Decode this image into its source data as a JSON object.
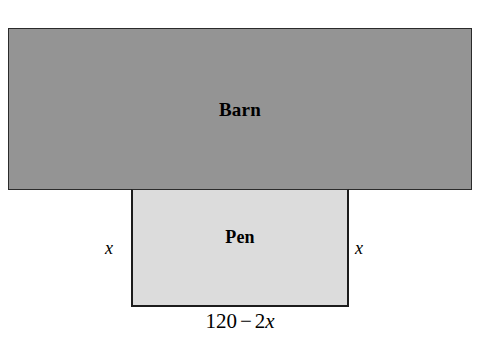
{
  "figure": {
    "type": "geometry-diagram",
    "background_color": "#ffffff",
    "shapes": {
      "barn": {
        "label": "Barn",
        "fill_color": "#949494",
        "border_color": "#2b2b2b"
      },
      "pen": {
        "label": "Pen",
        "fill_color": "#dcdcdc",
        "border_color": "#1c1c1c"
      }
    },
    "annotations": {
      "left_side": "x",
      "right_side": "x",
      "bottom": {
        "constant": "120",
        "operator": "−",
        "coefficient": "2",
        "variable": "x",
        "full": "120 − 2x"
      }
    }
  }
}
